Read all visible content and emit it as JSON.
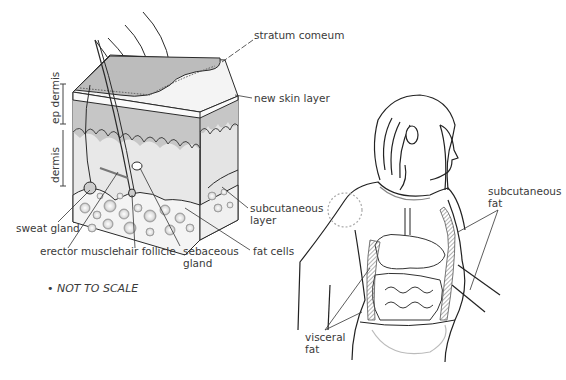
{
  "skin_diagram": {
    "labels": {
      "stratum": "stratum comeum",
      "new_skin": "new skin layer",
      "epidermis": "ep dermis",
      "dermis": "dermis",
      "subcutaneous_layer": [
        "subcutaneous",
        "layer"
      ],
      "sweat_gland": "sweat gland",
      "erector_muscle": "erector muscle",
      "hair_follicle": "hair follicle",
      "sebaceous_gland": [
        "sebaceous",
        "gland"
      ],
      "fat_cells": "fat cells"
    },
    "note": "• NOT TO SCALE"
  },
  "body_diagram": {
    "labels": {
      "subcutaneous_fat": [
        "subcutaneous",
        "fat"
      ],
      "visceral_fat": [
        "visceral",
        "fat"
      ]
    }
  },
  "colors": {
    "outline": "#2a2a2a",
    "stratum_fill": "#bdbdbd",
    "epidermis_fill": "#c8c8c8",
    "dermis_fill": "#e6e6e6",
    "fat_fill": "#f2f2f2",
    "hatch": "#777777"
  }
}
